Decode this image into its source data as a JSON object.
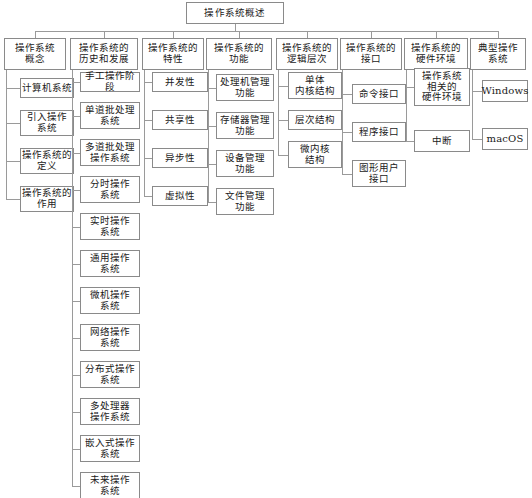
{
  "diagram": {
    "type": "tree-mind-map",
    "title": "操作系统概述",
    "root": {
      "label": "操作系统概述"
    },
    "branches": [
      {
        "label": "操作系统\n概念",
        "children": [
          {
            "label": "计算机系统"
          },
          {
            "label": "引入操作\n系统"
          },
          {
            "label": "操作系统的\n定义"
          },
          {
            "label": "操作系统的\n作用"
          }
        ]
      },
      {
        "label": "操作系统的\n历史和发展",
        "children": [
          {
            "label": "手工操作阶段"
          },
          {
            "label": "单道批处理\n系统"
          },
          {
            "label": "多道批处理\n操作系统"
          },
          {
            "label": "分时操作\n系统"
          },
          {
            "label": "实时操作\n系统"
          },
          {
            "label": "通用操作\n系统"
          },
          {
            "label": "微机操作\n系统"
          },
          {
            "label": "网络操作\n系统"
          },
          {
            "label": "分布式操作\n系统"
          },
          {
            "label": "多处理器\n操作系统"
          },
          {
            "label": "嵌入式操作\n系统"
          },
          {
            "label": "未来操作\n系统"
          }
        ]
      },
      {
        "label": "操作系统的\n特性",
        "children": [
          {
            "label": "并发性"
          },
          {
            "label": "共享性"
          },
          {
            "label": "异步性"
          },
          {
            "label": "虚拟性"
          }
        ]
      },
      {
        "label": "操作系统的\n功能",
        "children": [
          {
            "label": "处理机管理\n功能"
          },
          {
            "label": "存储器管理\n功能"
          },
          {
            "label": "设备管理\n功能"
          },
          {
            "label": "文件管理\n功能"
          }
        ]
      },
      {
        "label": "操作系统的\n逻辑层次",
        "children": [
          {
            "label": "单体\n内核结构"
          },
          {
            "label": "层次结构"
          },
          {
            "label": "微内核\n结构"
          }
        ]
      },
      {
        "label": "操作系统的\n接口",
        "children": [
          {
            "label": "命令接口"
          },
          {
            "label": "程序接口"
          },
          {
            "label": "图形用户\n接口"
          }
        ]
      },
      {
        "label": "操作系统的\n硬件环境",
        "children": [
          {
            "label": "操作系统\n相关的\n硬件环境"
          },
          {
            "label": "中断"
          }
        ]
      },
      {
        "label": "典型操作\n系统",
        "children": [
          {
            "label": "Windows",
            "script": "latin"
          },
          {
            "label": "macOS",
            "script": "latin"
          }
        ]
      }
    ]
  },
  "style": {
    "border_color": "#8a8a8a",
    "line_color": "#9a9a9a",
    "background": "#ffffff",
    "text_color": "#1a1a1a"
  }
}
